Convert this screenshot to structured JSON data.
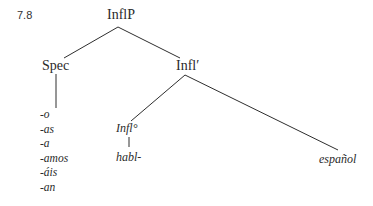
{
  "example_number": "7.8",
  "tree": {
    "root": "InflP",
    "spec": "Spec",
    "infl_bar": "Infl′",
    "infl_head": "Infl°",
    "verb_stem": "habl-",
    "complement": "español",
    "spec_suffixes": [
      "-o",
      "-as",
      "-a",
      "-amos",
      "-áis",
      "-an"
    ]
  }
}
